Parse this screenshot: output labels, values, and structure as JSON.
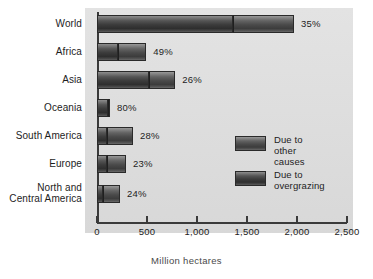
{
  "chart_data": {
    "type": "bar",
    "orientation": "horizontal",
    "stacked": true,
    "title": "",
    "xlabel": "Million hectares",
    "ylabel": "",
    "xlim": [
      0,
      2500
    ],
    "xticks": [
      0,
      500,
      1000,
      1500,
      2000,
      2500
    ],
    "xtick_labels": [
      "0",
      "500",
      "1,000",
      "1,500",
      "2,000",
      "2,500"
    ],
    "grid": false,
    "legend_position": "inside-right",
    "categories": [
      "World",
      "Africa",
      "Asia",
      "Oceania",
      "South America",
      "Europe",
      "North and\nCentral America"
    ],
    "series": [
      {
        "name": "Due to overgrazing",
        "values": [
          1355,
          210,
          515,
          105,
          100,
          95,
          55
        ]
      },
      {
        "name": "Due to other causes",
        "values": [
          615,
          282,
          268,
          25,
          260,
          195,
          175
        ]
      }
    ],
    "totals": [
      1970,
      492,
      783,
      130,
      360,
      290,
      230
    ],
    "data_labels": [
      "35%",
      "49%",
      "26%",
      "80%",
      "28%",
      "23%",
      "24%"
    ],
    "data_label_meaning": "share due to overgrazing",
    "colors": {
      "overgrazing": "#3b3b3b",
      "other_causes": "#4a4a4a",
      "plot_background": "#dcdcdc",
      "axis": "#3a3a3a",
      "text": "#1d1d1d"
    }
  },
  "legend": {
    "items": [
      {
        "label": "Due to\nother causes",
        "swatch": "other_causes"
      },
      {
        "label": "Due to\novergrazing",
        "swatch": "overgrazing"
      }
    ]
  },
  "axis": {
    "x_title": "Million hectares"
  }
}
